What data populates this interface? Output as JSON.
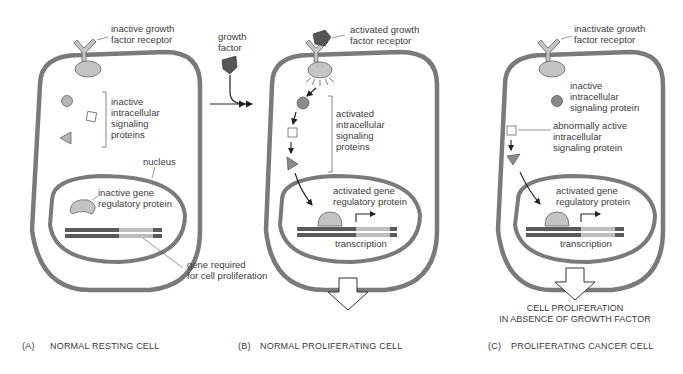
{
  "figure": {
    "colors": {
      "membrane": "#7a7a7a",
      "protein_fill": "#c4c4c4",
      "growth_factor": "#555555",
      "dna_dark": "#5a5a5a",
      "dna_light": "#bdbdbd"
    },
    "panels": [
      {
        "id": "A",
        "caption_letter": "(A)",
        "caption": "NORMAL RESTING CELL",
        "labels": {
          "receptor": "inactive growth\nfactor receptor",
          "signaling": "inactive\nintracellular\nsignaling\nproteins",
          "nucleus": "nucleus",
          "gene_reg": "inactive gene\nregulatory protein",
          "gene": "gene required\nfor cell proliferation"
        }
      },
      {
        "id": "B",
        "caption_letter": "(B)",
        "caption": "NORMAL PROLIFERATING CELL",
        "labels": {
          "growth_factor": "growth\nfactor",
          "receptor": "activated growth\nfactor receptor",
          "signaling": "activated\nintracellular\nsignaling\nproteins",
          "gene_reg": "activated gene\nregulatory protein",
          "transcription": "transcription"
        }
      },
      {
        "id": "C",
        "caption_letter": "(C)",
        "caption": "PROLIFERATING CANCER CELL",
        "labels": {
          "receptor": "inactivate growth\nfactor receptor",
          "inactive_signal": "inactive\nintracellular\nsignaling protein",
          "abnormal_signal": "abnormally active\nintracellular\nsignaling protein",
          "gene_reg": "activated gene\nregulatory protein",
          "transcription": "transcription",
          "outcome": "CELL PROLIFERATION\nIN ABSENCE OF GROWTH FACTOR"
        }
      }
    ]
  }
}
